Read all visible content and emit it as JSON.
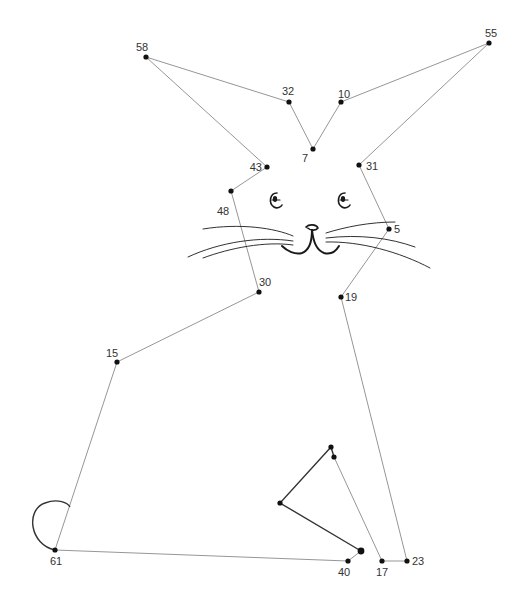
{
  "puzzle": {
    "type": "connect-the-dots",
    "subject": "rabbit",
    "colors": {
      "background": "#ffffff",
      "line": "#8a8a8a",
      "dot": "#111111",
      "label": "#333333",
      "ink": "#1a1a1a"
    },
    "dots": [
      {
        "label": "58",
        "x": 146,
        "y": 57,
        "lx": 136,
        "ly": 51,
        "anchor": "start"
      },
      {
        "label": "32",
        "x": 289,
        "y": 102,
        "lx": 282,
        "ly": 95,
        "anchor": "start"
      },
      {
        "label": "10",
        "x": 341,
        "y": 102,
        "lx": 338,
        "ly": 98,
        "anchor": "start"
      },
      {
        "label": "55",
        "x": 489,
        "y": 43,
        "lx": 485,
        "ly": 37,
        "anchor": "start"
      },
      {
        "label": "7",
        "x": 313,
        "y": 149,
        "lx": 302,
        "ly": 162,
        "anchor": "start"
      },
      {
        "label": "43",
        "x": 267,
        "y": 167,
        "lx": 262,
        "ly": 171,
        "anchor": "end"
      },
      {
        "label": "31",
        "x": 359,
        "y": 165,
        "lx": 366,
        "ly": 170,
        "anchor": "start"
      },
      {
        "label": "48",
        "x": 231,
        "y": 191,
        "lx": 217,
        "ly": 215,
        "anchor": "start"
      },
      {
        "label": "5",
        "x": 389,
        "y": 229,
        "lx": 394,
        "ly": 233,
        "anchor": "start"
      },
      {
        "label": "30",
        "x": 259,
        "y": 292,
        "lx": 259,
        "ly": 286,
        "anchor": "start"
      },
      {
        "label": "19",
        "x": 341,
        "y": 297,
        "lx": 345,
        "ly": 301,
        "anchor": "start"
      },
      {
        "label": "15",
        "x": 117,
        "y": 362,
        "lx": 106,
        "ly": 357,
        "anchor": "start"
      },
      {
        "label": "61",
        "x": 55,
        "y": 550,
        "lx": 50,
        "ly": 565,
        "anchor": "start"
      },
      {
        "label": "40",
        "x": 348,
        "y": 561,
        "lx": 338,
        "ly": 576,
        "anchor": "start"
      },
      {
        "label": "17",
        "x": 382,
        "y": 561,
        "lx": 376,
        "ly": 576,
        "anchor": "start"
      },
      {
        "label": "23",
        "x": 407,
        "y": 561,
        "lx": 412,
        "ly": 565,
        "anchor": "start"
      },
      {
        "label": "",
        "x": 331,
        "y": 447
      },
      {
        "label": "",
        "x": 334,
        "y": 457
      },
      {
        "label": "",
        "x": 280,
        "y": 503
      },
      {
        "label": "",
        "x": 361,
        "y": 551
      }
    ],
    "guide_paths": [
      "M146,57 L289,102 L313,149 L341,102 L489,43 L359,165 L389,229 L341,297 L407,561 L382,561 L334,457",
      "M146,57 L267,167 L231,191 L259,292 L117,362 L55,550 L348,561 L361,551"
    ],
    "solid_paths": [
      "M331,447 L280,503 L361,551",
      "M331,447 L334,457"
    ],
    "tail_path": "M55,550 C30,545 25,510 45,503 C58,498 68,503 70,507"
  }
}
